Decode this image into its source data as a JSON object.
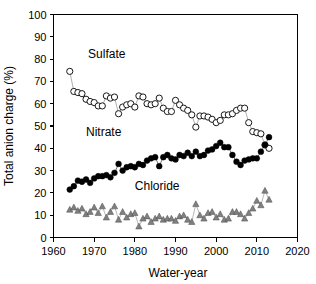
{
  "chart_data": {
    "type": "line",
    "title": "",
    "xlabel": "Water-year",
    "ylabel": "Total anion charge (%)",
    "xlim": [
      1960,
      2020
    ],
    "ylim": [
      0,
      100
    ],
    "xticks": [
      1960,
      1970,
      1980,
      1990,
      2000,
      2010,
      2020
    ],
    "yticks": [
      0,
      10,
      20,
      30,
      40,
      50,
      60,
      70,
      80,
      90,
      100
    ],
    "grid": false,
    "legend": "inline-annotations",
    "annotations": [
      {
        "text": "Sulfate",
        "x": 1968.5,
        "y": 80.5
      },
      {
        "text": "Nitrate",
        "x": 1968.0,
        "y": 45.5
      },
      {
        "text": "Chloride",
        "x": 1980.0,
        "y": 21.5
      }
    ],
    "series": [
      {
        "name": "Sulfate",
        "marker": "open-circle",
        "color": "#000000",
        "fill": "#ffffff",
        "x": [
          1964,
          1965,
          1966,
          1967,
          1968,
          1969,
          1970,
          1971,
          1972,
          1973,
          1974,
          1975,
          1976,
          1977,
          1978,
          1979,
          1980,
          1981,
          1982,
          1983,
          1984,
          1985,
          1986,
          1987,
          1988,
          1989,
          1990,
          1991,
          1992,
          1993,
          1994,
          1995,
          1996,
          1997,
          1998,
          1999,
          2000,
          2001,
          2002,
          2003,
          2004,
          2005,
          2006,
          2007,
          2008,
          2009,
          2010,
          2011,
          2012,
          2013
        ],
        "values": [
          74.5,
          65.5,
          65.0,
          64.5,
          62.0,
          61.0,
          60.5,
          59.0,
          59.0,
          63.5,
          62.5,
          63.0,
          55.5,
          58.5,
          59.5,
          60.0,
          58.5,
          63.5,
          63.0,
          60.0,
          59.5,
          60.0,
          62.5,
          58.0,
          56.5,
          56.5,
          61.5,
          59.5,
          58.0,
          57.0,
          55.0,
          49.5,
          54.5,
          54.5,
          54.0,
          53.0,
          51.5,
          52.5,
          55.0,
          55.0,
          55.5,
          57.0,
          58.0,
          58.0,
          51.5,
          47.5,
          47.0,
          46.5,
          41.5,
          40.0
        ]
      },
      {
        "name": "Nitrate",
        "marker": "filled-circle",
        "color": "#000000",
        "fill": "#000000",
        "x": [
          1964,
          1965,
          1966,
          1967,
          1968,
          1969,
          1970,
          1971,
          1972,
          1973,
          1974,
          1975,
          1976,
          1977,
          1978,
          1979,
          1980,
          1981,
          1982,
          1983,
          1984,
          1985,
          1986,
          1987,
          1988,
          1989,
          1990,
          1991,
          1992,
          1993,
          1994,
          1995,
          1996,
          1997,
          1998,
          1999,
          2000,
          2001,
          2002,
          2003,
          2004,
          2005,
          2006,
          2007,
          2008,
          2009,
          2010,
          2011,
          2012,
          2013
        ],
        "values": [
          21.5,
          23.0,
          25.5,
          25.0,
          26.0,
          24.5,
          26.5,
          27.5,
          27.5,
          28.0,
          27.0,
          29.0,
          33.0,
          30.0,
          31.5,
          32.0,
          31.5,
          33.0,
          32.5,
          34.5,
          35.5,
          36.0,
          32.0,
          36.0,
          37.0,
          35.5,
          35.0,
          37.0,
          36.5,
          38.0,
          36.5,
          38.5,
          36.5,
          37.0,
          39.0,
          39.5,
          41.0,
          42.5,
          40.5,
          40.5,
          37.0,
          34.0,
          32.5,
          34.5,
          35.0,
          35.5,
          35.5,
          38.5,
          41.5,
          45.0
        ]
      },
      {
        "name": "Chloride",
        "marker": "filled-triangle",
        "color": "#808080",
        "fill": "#808080",
        "x": [
          1964,
          1965,
          1966,
          1967,
          1968,
          1969,
          1970,
          1971,
          1972,
          1973,
          1974,
          1975,
          1976,
          1977,
          1978,
          1979,
          1980,
          1981,
          1982,
          1983,
          1984,
          1985,
          1986,
          1987,
          1988,
          1989,
          1990,
          1991,
          1992,
          1993,
          1994,
          1995,
          1996,
          1997,
          1998,
          1999,
          2000,
          2001,
          2002,
          2003,
          2004,
          2005,
          2006,
          2007,
          2008,
          2009,
          2010,
          2011,
          2012,
          2013
        ],
        "values": [
          12.5,
          13.5,
          12.0,
          13.0,
          10.5,
          11.5,
          13.5,
          11.0,
          14.0,
          9.0,
          11.5,
          14.0,
          8.0,
          11.5,
          9.0,
          10.5,
          11.0,
          5.0,
          8.5,
          9.5,
          7.0,
          8.5,
          9.5,
          8.0,
          8.5,
          8.5,
          7.5,
          9.5,
          10.0,
          8.0,
          7.0,
          15.0,
          10.0,
          8.5,
          11.0,
          11.5,
          9.0,
          10.5,
          8.0,
          8.5,
          11.5,
          11.5,
          10.5,
          8.5,
          11.0,
          13.0,
          16.5,
          14.5,
          21.0,
          17.0
        ]
      }
    ]
  },
  "figure": {
    "background": "#ffffff",
    "frame_color": "#000000"
  }
}
